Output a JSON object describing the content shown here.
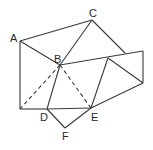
{
  "diagram": {
    "labels": {
      "A": "A",
      "B": "B",
      "C": "C",
      "D": "D",
      "E": "E",
      "F": "F"
    },
    "points": {
      "A": [
        20,
        41
      ],
      "B": [
        60,
        65
      ],
      "C": [
        92,
        20
      ],
      "D": [
        47,
        109
      ],
      "E": [
        91,
        108
      ],
      "F": [
        65,
        128
      ],
      "P_bottom_left": [
        20,
        109
      ],
      "P_top_right": [
        143,
        51
      ],
      "P_right": [
        143,
        83
      ],
      "P_inner": [
        108,
        58
      ],
      "P_c_meet": [
        125,
        53
      ]
    },
    "solid_segments": [
      [
        "A",
        "C"
      ],
      [
        "A",
        "B"
      ],
      [
        "A",
        "P_bottom_left"
      ],
      [
        "C",
        "B"
      ],
      [
        "C",
        "P_c_meet"
      ],
      [
        "B",
        "P_top_right"
      ],
      [
        "P_top_right",
        "P_right"
      ],
      [
        "P_inner",
        "P_right"
      ],
      [
        "P_inner",
        "E"
      ],
      [
        "B",
        "D"
      ],
      [
        "P_bottom_left",
        "D"
      ],
      [
        "D",
        "E"
      ],
      [
        "D",
        "F"
      ],
      [
        "F",
        "E"
      ],
      [
        "E",
        "P_right"
      ]
    ],
    "dashed_segments": [
      [
        "B",
        "P_bottom_left"
      ],
      [
        "B",
        "E"
      ]
    ]
  }
}
